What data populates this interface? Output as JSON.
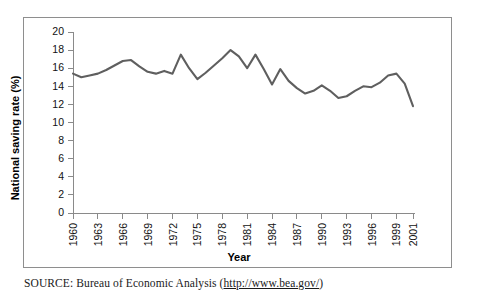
{
  "figure": {
    "source_label": "SOURCE:",
    "source_text": " Bureau of Economic Analysis (",
    "source_url": "http://www.bea.gov/",
    "source_close": ")"
  },
  "chart_data": {
    "type": "line",
    "title": "",
    "xlabel": "Year",
    "ylabel": "National saving rate (%)",
    "xlim": [
      1960,
      2001
    ],
    "ylim": [
      0,
      20
    ],
    "grid": false,
    "legend": null,
    "line_color": "#5f5f5f",
    "ytick_labels": [
      "0",
      "2",
      "4",
      "6",
      "8",
      "10",
      "12",
      "14",
      "16",
      "18",
      "20"
    ],
    "ytick_values": [
      0,
      2,
      4,
      6,
      8,
      10,
      12,
      14,
      16,
      18,
      20
    ],
    "xtick_labels": [
      "1960",
      "1963",
      "1966",
      "1969",
      "1972",
      "1975",
      "1978",
      "1981",
      "1984",
      "1987",
      "1990",
      "1993",
      "1996",
      "1999",
      "2001"
    ],
    "xtick_values": [
      1960,
      1963,
      1966,
      1969,
      1972,
      1975,
      1978,
      1981,
      1984,
      1987,
      1990,
      1993,
      1996,
      1999,
      2001
    ],
    "x": [
      1960,
      1961,
      1962,
      1963,
      1964,
      1965,
      1966,
      1967,
      1968,
      1969,
      1970,
      1971,
      1972,
      1973,
      1974,
      1975,
      1976,
      1977,
      1978,
      1979,
      1980,
      1981,
      1982,
      1983,
      1984,
      1985,
      1986,
      1987,
      1988,
      1989,
      1990,
      1991,
      1992,
      1993,
      1994,
      1995,
      1996,
      1997,
      1998,
      1999,
      2000,
      2001
    ],
    "values": [
      15.4,
      15.0,
      15.2,
      15.4,
      15.8,
      16.3,
      16.8,
      16.9,
      16.2,
      15.6,
      15.4,
      15.7,
      15.4,
      17.5,
      16.0,
      14.8,
      15.5,
      16.3,
      17.1,
      18.0,
      17.3,
      16.0,
      17.5,
      15.9,
      14.2,
      15.9,
      14.6,
      13.8,
      13.2,
      13.5,
      14.1,
      13.5,
      12.7,
      12.9,
      13.5,
      14.0,
      13.9,
      14.4,
      15.2,
      15.4,
      14.3,
      11.8
    ],
    "series_name": "National saving rate"
  }
}
